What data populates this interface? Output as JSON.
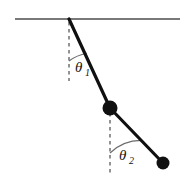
{
  "figure": {
    "name": "double-pendulum-diagram",
    "background_color": "#ffffff",
    "width": 190,
    "height": 188
  },
  "ceiling": {
    "label": "support-line",
    "color": "#4d4d4d",
    "x1": 15,
    "y1": 19,
    "x2": 180,
    "y2": 19,
    "thickness": 1.6
  },
  "pivot": {
    "x": 69,
    "y": 19
  },
  "rods": [
    {
      "name": "upper-rod",
      "color": "#101010",
      "thickness": 3.2,
      "x1": 69,
      "y1": 19,
      "x2": 110,
      "y2": 108
    },
    {
      "name": "lower-rod",
      "color": "#101010",
      "thickness": 3.2,
      "x1": 110,
      "y1": 108,
      "x2": 163,
      "y2": 163
    }
  ],
  "masses": [
    {
      "name": "upper-bob",
      "cx": 110,
      "cy": 108,
      "r": 7.5,
      "color": "#101010"
    },
    {
      "name": "lower-bob",
      "cx": 163,
      "cy": 163,
      "r": 6.5,
      "color": "#101010"
    }
  ],
  "reference_lines": [
    {
      "name": "upper-vertical-dashed",
      "color": "#5a5a5a",
      "x1": 69,
      "y1": 22,
      "x2": 69,
      "y2": 81,
      "dash": "3.5,3.5",
      "thickness": 1.3
    },
    {
      "name": "lower-vertical-dashed",
      "color": "#5a5a5a",
      "x1": 110,
      "y1": 113,
      "x2": 110,
      "y2": 173,
      "dash": "3.5,3.5",
      "thickness": 1.3
    }
  ],
  "angles": [
    {
      "name": "theta-1",
      "symbol": "θ",
      "subscript": "1",
      "arc": {
        "cx": 69,
        "cy": 19,
        "r": 42,
        "start_deg": 90,
        "end_deg": 65
      },
      "arc_color": "#6b6b6b",
      "label_x": 75,
      "label_y": 72
    },
    {
      "name": "theta-2",
      "symbol": "θ",
      "subscript": "2",
      "arc": {
        "cx": 110,
        "cy": 108,
        "r": 45,
        "start_deg": 90,
        "end_deg": 46
      },
      "arc_color": "#6b6b6b",
      "label_x": 119,
      "label_y": 160
    }
  ]
}
